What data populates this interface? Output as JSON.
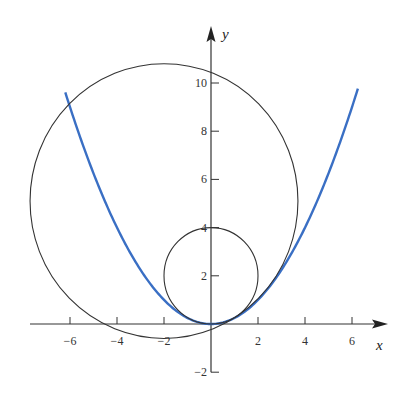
{
  "chart_data": {
    "type": "line",
    "title": "",
    "xlabel": "x",
    "ylabel": "y",
    "xlim": [
      -7.6,
      7.4
    ],
    "ylim": [
      -2,
      11.5
    ],
    "grid": false,
    "x_ticks": [
      -6,
      -4,
      -2,
      2,
      4,
      6
    ],
    "y_ticks": [
      -2,
      2,
      4,
      6,
      8,
      10
    ],
    "x_tick_labels": [
      "-6",
      "-4",
      "-2",
      "2",
      "4",
      "6"
    ],
    "y_tick_labels": [
      "-2",
      "2",
      "4",
      "6",
      "8",
      "10"
    ],
    "series": [
      {
        "name": "parabola",
        "equation": "y = x^2/4",
        "color": "#3a6fc4",
        "x_range": [
          -6.2,
          6.25
        ]
      },
      {
        "name": "small circle",
        "shape": "circle",
        "center": [
          0,
          2
        ],
        "radius": 2,
        "color": "#333333"
      },
      {
        "name": "large circle",
        "shape": "circle",
        "center": [
          -2,
          5.1
        ],
        "radius": 5.7,
        "color": "#333333"
      }
    ]
  }
}
